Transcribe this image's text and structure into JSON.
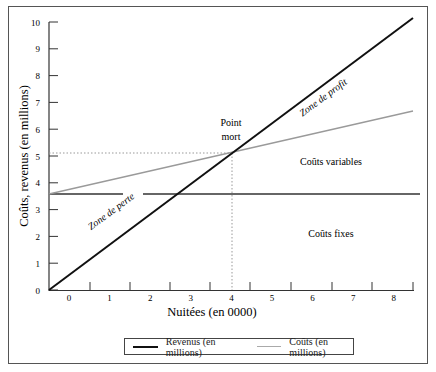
{
  "chart_data": {
    "type": "line",
    "title": "",
    "xlabel": "Nuitées (en 0000)",
    "ylabel": "Coûts, revenus (en millions)",
    "x_ticks": [
      "0",
      "1",
      "2",
      "3",
      "4",
      "5",
      "6",
      "7",
      "8"
    ],
    "y_ticks": [
      "0",
      "1",
      "2",
      "3",
      "4",
      "5",
      "6",
      "7",
      "8",
      "9",
      "10"
    ],
    "ylim": [
      0,
      10
    ],
    "xlim": [
      -0.5,
      8.5
    ],
    "series": [
      {
        "name": "Revenus (en millions)",
        "color": "#111111",
        "x": [
          -0.5,
          8.5
        ],
        "y": [
          0,
          10.15
        ]
      },
      {
        "name": "Coûts (en millions)",
        "color": "#999999",
        "x": [
          -0.5,
          8.5
        ],
        "y": [
          3.6,
          6.75
        ]
      },
      {
        "name": "Coûts fixes",
        "color": "#333333",
        "x": [
          -0.5,
          8.5
        ],
        "y": [
          3.6,
          3.6
        ]
      }
    ],
    "break_even": {
      "x": 3.9,
      "y": 5.1
    },
    "annotations": [
      "Point mort",
      "Zone de profit",
      "Zone de perte",
      "Coûts variables",
      "Coûts fixes"
    ],
    "legend_position": "bottom",
    "grid": false
  },
  "labels": {
    "point_mort_1": "Point",
    "point_mort_2": "mort",
    "zone_profit": "Zone de profit",
    "zone_perte": "Zone de perte",
    "couts_variables": "Coûts variables",
    "couts_fixes": "Coûts fixes"
  },
  "legend": {
    "revenus": "Revenus (en millions)",
    "couts": "Coûts (en millions)"
  }
}
